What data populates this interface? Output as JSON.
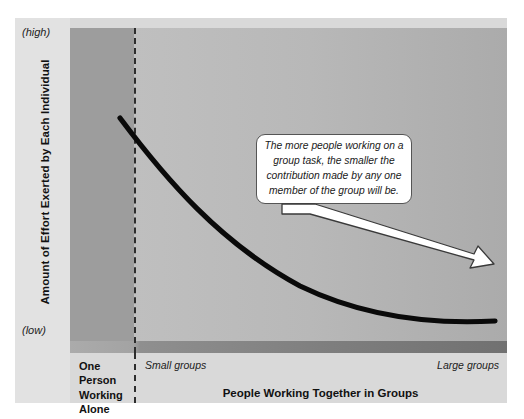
{
  "chart_data": {
    "type": "line",
    "title": "",
    "xlabel": "People Working Together in Groups",
    "ylabel": "Amount of Effort Exerted by Each Individual",
    "y_high_tick": "(high)",
    "y_low_tick": "(low)",
    "x_ticks": [
      "One Person Working Alone",
      "Small groups",
      "Large groups"
    ],
    "x_zone_solo_label": "One Person\nWorking\nAlone",
    "x_zone_small_label": "Small groups",
    "x_zone_large_label": "Large groups",
    "grid": false,
    "legend": "none",
    "xlim": [
      0,
      100
    ],
    "ylim": [
      0,
      100
    ],
    "series": [
      {
        "name": "Effort per individual",
        "x": [
          8,
          16,
          24,
          32,
          40,
          50,
          60,
          70,
          80,
          90,
          95
        ],
        "values": [
          78,
          68,
          58,
          50,
          43,
          34,
          27,
          22,
          18,
          16,
          15
        ]
      }
    ],
    "annotation": {
      "text": "The more people working on a group task, the smaller the contribution made by any one member of the group will be.",
      "arrow_from_x": 56,
      "arrow_from_y": 58,
      "arrow_to_x": 95,
      "arrow_to_y": 27
    },
    "divider_x_fraction": 0.146,
    "divider_style": "dashed"
  },
  "axes": {
    "y": {
      "title": "Amount of Effort Exerted by Each Individual",
      "high_label": "(high)",
      "low_label": "(low)"
    },
    "x": {
      "title": "People Working Together in Groups",
      "solo_label": "One Person Working Alone",
      "small_label": "Small groups",
      "large_label": "Large groups"
    }
  },
  "callout": {
    "text": "The more people working on a group task, the smaller the contribution made by any one member of the group will be."
  },
  "colors": {
    "figure_background": "#d9d9d9",
    "axis_band": "#e2e2e2",
    "plot_light": "#c3c3c3",
    "plot_dark": "#ababab",
    "solo_band": "#9d9d9d",
    "floor_band": "#7e7e7e",
    "curve": "#0a0a0a",
    "divider": "#2d2d2d",
    "callout_fill": "#ffffff",
    "callout_border": "#555555",
    "arrow_fill": "#ffffff",
    "arrow_stroke": "#3a3a3a",
    "text": "#111111"
  }
}
